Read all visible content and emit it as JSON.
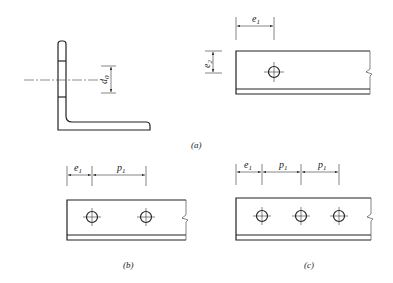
{
  "figure": {
    "labels": {
      "d0": "d",
      "d0_sub": "0",
      "e1": "e",
      "e1_sub": "1",
      "e2": "e",
      "e2_sub": "2",
      "p1": "p",
      "p1_sub": "1"
    },
    "captions": {
      "a": "(a)",
      "b": "(b)",
      "c": "(c)"
    },
    "panels": [
      {
        "id": "a",
        "description": "Angle section with hole diameter d0; plate with one hole, end distance e1, edge distance e2"
      },
      {
        "id": "b",
        "description": "Plate with two holes, end distance e1, pitch p1"
      },
      {
        "id": "c",
        "description": "Plate with three holes, end distance e1, pitch p1, pitch p1"
      }
    ]
  }
}
